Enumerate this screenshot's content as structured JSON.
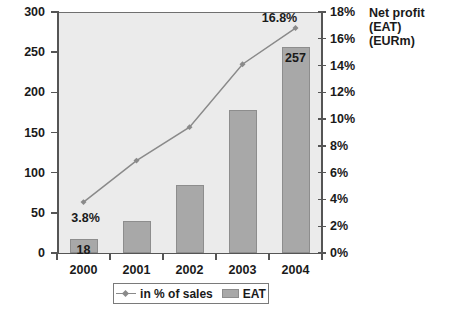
{
  "chart_data": {
    "type": "bar",
    "title": "",
    "categories": [
      "2000",
      "2001",
      "2002",
      "2003",
      "2004"
    ],
    "xlabel": "",
    "grid": false,
    "legend_position": "bottom",
    "series": [
      {
        "name": "EAT",
        "type": "bar",
        "axis": "left",
        "values": [
          18,
          40,
          85,
          178,
          257
        ],
        "labels": [
          "18",
          "",
          "",
          "",
          "257"
        ],
        "color": "#a8a8a8"
      },
      {
        "name": "in % of sales",
        "type": "line",
        "axis": "right",
        "values": [
          3.8,
          6.9,
          9.4,
          14.1,
          16.8
        ],
        "labels": [
          "3.8%",
          "",
          "",
          "",
          "16.8%"
        ],
        "color": "#8a8a8a"
      }
    ],
    "left_axis": {
      "label": "",
      "ylim": [
        0,
        300
      ],
      "ticks": [
        0,
        50,
        100,
        150,
        200,
        250,
        300
      ],
      "ticklabels": [
        "0",
        "50",
        "100",
        "150",
        "200",
        "250",
        "300"
      ]
    },
    "right_axis": {
      "title_line1": "Net profit (EAT)",
      "title_line2": "(EURm)",
      "ylim": [
        0,
        18
      ],
      "ticks": [
        0,
        2,
        4,
        6,
        8,
        10,
        12,
        14,
        16,
        18
      ],
      "ticklabels": [
        "0%",
        "2%",
        "4%",
        "6%",
        "8%",
        "10%",
        "12%",
        "14%",
        "16%",
        "18%"
      ]
    },
    "legend": {
      "entries": [
        {
          "label": "in % of sales",
          "marker": "line-diamond"
        },
        {
          "label": "EAT",
          "marker": "box"
        }
      ]
    },
    "colors": {
      "plot_background": "#ebebeb",
      "bar_fill": "#a8a8a8",
      "bar_edge": "#8d8d8d",
      "line": "#8a8a8a",
      "axis": "#555555",
      "text": "#1a1a1a",
      "canvas": "#ffffff"
    }
  }
}
